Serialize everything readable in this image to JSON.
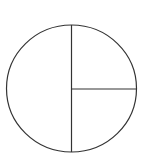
{
  "diagram": {
    "type": "fraction-circle",
    "parts": [
      {
        "name": "left-half",
        "fraction": "1/2"
      },
      {
        "name": "top-right-quarter",
        "fraction": "1/4"
      },
      {
        "name": "bottom-right-quarter",
        "fraction": "1/4"
      }
    ],
    "stroke_color": "#333333",
    "fill_color": "#ffffff"
  }
}
